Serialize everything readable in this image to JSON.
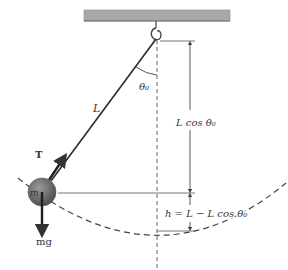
{
  "diagram": {
    "labels": {
      "length": "L",
      "angle": "θ₀",
      "tension": "T",
      "mass": "m",
      "weight": "mg",
      "vertical_component": "L cos θ₀",
      "height": "h = L − L cos θ₀"
    },
    "colors": {
      "ceiling": "#a8a8a8",
      "ceiling_edge": "#7a7a7a",
      "string": "#2a2a2a",
      "bob": "#6e6e6e",
      "line": "#555555",
      "text": "#333333"
    }
  }
}
